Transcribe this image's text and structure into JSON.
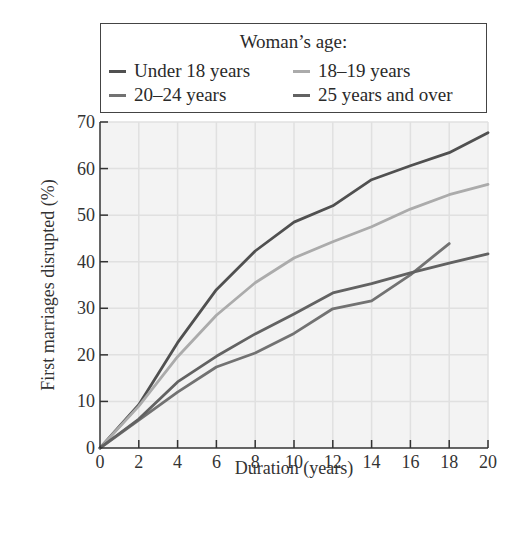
{
  "chart_data": {
    "type": "line",
    "title": "",
    "xlabel": "Duration (years)",
    "ylabel": "First marriages disrupted (%)",
    "xlim": [
      0,
      20
    ],
    "ylim": [
      0,
      70
    ],
    "xticks": [
      0,
      2,
      4,
      6,
      8,
      10,
      12,
      14,
      16,
      18,
      20
    ],
    "yticks": [
      0,
      10,
      20,
      30,
      40,
      50,
      60,
      70
    ],
    "grid": true,
    "legend": {
      "title": "Woman’s age:",
      "position": "top"
    },
    "series": [
      {
        "name": "Under 18 years",
        "color": "#505050",
        "x": [
          0,
          2,
          4,
          6,
          8,
          10,
          12,
          14,
          16,
          18,
          20
        ],
        "y": [
          0,
          9.3,
          22.6,
          34,
          42.3,
          48.5,
          52,
          57.6,
          60.6,
          63.4,
          67.7
        ]
      },
      {
        "name": "18–19 years",
        "color": "#ababab",
        "x": [
          0,
          2,
          4,
          6,
          8,
          10,
          12,
          14,
          16,
          18,
          20
        ],
        "y": [
          0,
          9,
          19.6,
          28.5,
          35.5,
          40.8,
          44.3,
          47.5,
          51.3,
          54.4,
          56.6
        ]
      },
      {
        "name": "20–24 years",
        "color": "#727272",
        "x": [
          0,
          2,
          4,
          6,
          8,
          10,
          12,
          14,
          16,
          18
        ],
        "y": [
          0,
          6,
          12,
          17.4,
          20.4,
          24.6,
          29.9,
          31.6,
          37.2,
          43.9
        ]
      },
      {
        "name": "25 years and over",
        "color": "#626262",
        "x": [
          0,
          2,
          4,
          6,
          8,
          10,
          12,
          14,
          16,
          18,
          20
        ],
        "y": [
          0,
          6.2,
          14.2,
          19.7,
          24.5,
          28.8,
          33.3,
          35.3,
          37.6,
          39.7,
          41.7
        ]
      }
    ]
  },
  "legend": {
    "title": "Woman’s age:",
    "items": [
      {
        "label": "Under 18 years",
        "color": "#505050"
      },
      {
        "label": "18–19 years",
        "color": "#ababab"
      },
      {
        "label": "20–24 years",
        "color": "#727272"
      },
      {
        "label": "25 years and over",
        "color": "#626262"
      }
    ]
  },
  "axes": {
    "x_title": "Duration (years)",
    "y_title": "First marriages disrupted (%)"
  }
}
